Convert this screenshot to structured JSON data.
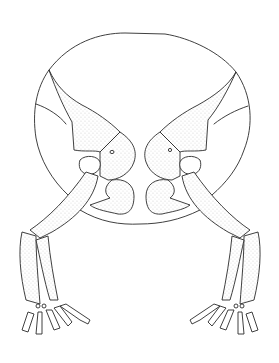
{
  "figure": {
    "style": "pen-and-ink with stippling",
    "colors": {
      "background": "#ffffff",
      "ink": "#2a2a2a"
    },
    "parts": {
      "outline": "circular body outline",
      "left_limb": [
        "ilium",
        "acetabulum",
        "ischium",
        "femur",
        "tibia",
        "fibula",
        "tarsals",
        "digits"
      ],
      "right_limb": [
        "ilium",
        "acetabulum",
        "ischium",
        "femur",
        "tibia",
        "fibula",
        "tarsals",
        "digits"
      ]
    }
  }
}
